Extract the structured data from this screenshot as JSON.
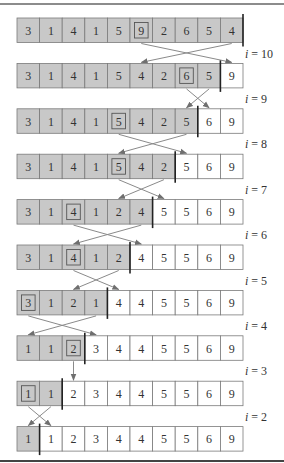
{
  "colors": {
    "unsorted_fill": "#c8c8c8",
    "sorted_fill": "#ffffff",
    "cell_border": "#7a7a7a",
    "boundary": "#222222",
    "arrow": "#8a8a8a",
    "frame_line": "#666666",
    "text": "#333333"
  },
  "rows": [
    {
      "values": [
        3,
        1,
        4,
        1,
        5,
        9,
        2,
        6,
        5,
        4
      ],
      "boxed": 5,
      "sorted_from": 10,
      "label": "i = 10",
      "swap": [
        5,
        9
      ]
    },
    {
      "values": [
        3,
        1,
        4,
        1,
        5,
        4,
        2,
        6,
        5,
        9
      ],
      "boxed": 7,
      "sorted_from": 9,
      "label": "i = 9",
      "swap": [
        7,
        8
      ]
    },
    {
      "values": [
        3,
        1,
        4,
        1,
        5,
        4,
        2,
        5,
        6,
        9
      ],
      "boxed": 4,
      "sorted_from": 8,
      "label": "i = 8",
      "swap": [
        4,
        7
      ]
    },
    {
      "values": [
        3,
        1,
        4,
        1,
        5,
        4,
        2,
        5,
        6,
        9
      ],
      "boxed": 4,
      "sorted_from": 7,
      "label": "i = 7",
      "swap": [
        4,
        6
      ]
    },
    {
      "values": [
        3,
        1,
        4,
        1,
        2,
        4,
        5,
        5,
        6,
        9
      ],
      "boxed": 2,
      "sorted_from": 6,
      "label": "i = 6",
      "swap": [
        2,
        5
      ]
    },
    {
      "values": [
        3,
        1,
        4,
        1,
        2,
        4,
        5,
        5,
        6,
        9
      ],
      "boxed": 2,
      "sorted_from": 5,
      "label": "i = 5",
      "swap": [
        2,
        4
      ]
    },
    {
      "values": [
        3,
        1,
        2,
        1,
        4,
        4,
        5,
        5,
        6,
        9
      ],
      "boxed": 0,
      "sorted_from": 4,
      "label": "i = 4",
      "swap": [
        0,
        3
      ]
    },
    {
      "values": [
        1,
        1,
        2,
        3,
        4,
        4,
        5,
        5,
        6,
        9
      ],
      "boxed": 2,
      "sorted_from": 3,
      "label": "i = 3",
      "swap": [
        2,
        2
      ]
    },
    {
      "values": [
        1,
        1,
        2,
        3,
        4,
        4,
        5,
        5,
        6,
        9
      ],
      "boxed": 0,
      "sorted_from": 2,
      "label": "i = 2",
      "swap": [
        0,
        1
      ]
    },
    {
      "values": [
        1,
        1,
        2,
        3,
        4,
        4,
        5,
        5,
        6,
        9
      ],
      "boxed": null,
      "sorted_from": 1,
      "label": null,
      "swap": null
    }
  ]
}
